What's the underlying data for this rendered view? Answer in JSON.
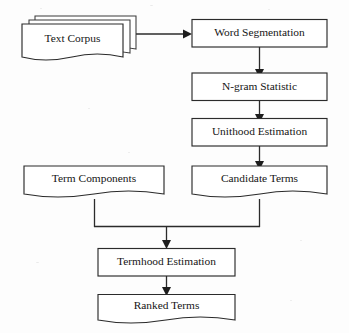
{
  "diagram": {
    "canvas": {
      "width": 349,
      "height": 333
    },
    "background_color": "#fdfdfd",
    "line_color": "#2b2b2b",
    "text_color": "#151515",
    "shape_fill": "#ffffff"
  },
  "nodes": {
    "text_corpus": {
      "label": "Text Corpus",
      "shape": "stacked-document",
      "stack_count": 3
    },
    "word_segmentation": {
      "label": "Word Segmentation",
      "shape": "rectangle"
    },
    "ngram_statistic": {
      "label": "N-gram Statistic",
      "shape": "rectangle"
    },
    "unithood_estimation": {
      "label": "Unithood Estimation",
      "shape": "rectangle"
    },
    "term_components": {
      "label": "Term Components",
      "shape": "document"
    },
    "candidate_terms": {
      "label": "Candidate Terms",
      "shape": "document"
    },
    "termhood_estimation": {
      "label": "Termhood Estimation",
      "shape": "rectangle"
    },
    "ranked_terms": {
      "label": "Ranked Terms",
      "shape": "document"
    }
  },
  "edges": [
    {
      "from": "text_corpus",
      "to": "word_segmentation",
      "direction": "right"
    },
    {
      "from": "word_segmentation",
      "to": "ngram_statistic",
      "direction": "down"
    },
    {
      "from": "ngram_statistic",
      "to": "unithood_estimation",
      "direction": "down"
    },
    {
      "from": "unithood_estimation",
      "to": "candidate_terms",
      "direction": "down"
    },
    {
      "from": "term_components",
      "to": "termhood_estimation",
      "direction": "down-merge"
    },
    {
      "from": "candidate_terms",
      "to": "termhood_estimation",
      "direction": "down-merge"
    },
    {
      "from": "termhood_estimation",
      "to": "ranked_terms",
      "direction": "down"
    }
  ]
}
